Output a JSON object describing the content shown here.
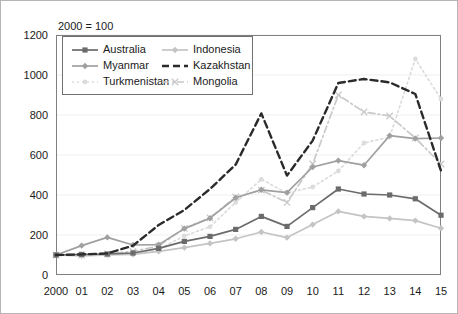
{
  "note": "2000 = 100",
  "legend": {
    "entries": [
      {
        "name": "Australia",
        "color": "#6b6b6b",
        "dash": "none",
        "marker": "square"
      },
      {
        "name": "Indonesia",
        "color": "#c4c4c4",
        "dash": "none",
        "marker": "diamond"
      },
      {
        "name": "Myanmar",
        "color": "#a0a0a0",
        "dash": "none",
        "marker": "diamond"
      },
      {
        "name": "Kazakhstan",
        "color": "#2b2b2b",
        "dash": "dashed",
        "marker": "none"
      },
      {
        "name": "Turkmenistan",
        "color": "#dcdcdc",
        "dash": "dotted",
        "marker": "circle"
      },
      {
        "name": "Mongolia",
        "color": "#c9c9c9",
        "dash": "dashdot",
        "marker": "cross"
      }
    ]
  },
  "chart_data": {
    "type": "line",
    "title": "",
    "subtitle": "2000 = 100",
    "xlabel": "",
    "ylabel": "",
    "ylim": [
      0,
      1200
    ],
    "yticks": [
      0,
      200,
      400,
      600,
      800,
      1000,
      1200
    ],
    "grid": true,
    "legend_position": "top-left-inside",
    "categories": [
      "2000",
      "01",
      "02",
      "03",
      "04",
      "05",
      "06",
      "07",
      "08",
      "09",
      "10",
      "11",
      "12",
      "13",
      "14",
      "15"
    ],
    "series": [
      {
        "name": "Australia",
        "color": "#6b6b6b",
        "dash": "none",
        "marker": "square",
        "values": [
          100,
          103,
          105,
          110,
          133,
          168,
          193,
          228,
          293,
          243,
          337,
          430,
          405,
          400,
          381,
          299
        ]
      },
      {
        "name": "Indonesia",
        "color": "#c4c4c4",
        "dash": "none",
        "marker": "diamond",
        "values": [
          100,
          95,
          100,
          103,
          118,
          137,
          158,
          181,
          215,
          187,
          252,
          318,
          293,
          283,
          272,
          234
        ]
      },
      {
        "name": "Myanmar",
        "color": "#a0a0a0",
        "dash": "none",
        "marker": "diamond",
        "values": [
          100,
          147,
          188,
          150,
          152,
          232,
          284,
          386,
          426,
          412,
          540,
          572,
          549,
          697,
          682,
          685
        ]
      },
      {
        "name": "Kazakhstan",
        "color": "#2b2b2b",
        "dash": "dashed",
        "marker": "none",
        "values": [
          100,
          103,
          108,
          147,
          250,
          325,
          430,
          552,
          808,
          497,
          672,
          960,
          980,
          963,
          905,
          521
        ]
      },
      {
        "name": "Turkmenistan",
        "color": "#dcdcdc",
        "dash": "dotted",
        "marker": "circle",
        "values": [
          100,
          97,
          105,
          107,
          128,
          196,
          241,
          363,
          478,
          410,
          440,
          520,
          660,
          690,
          1080,
          880
        ]
      },
      {
        "name": "Mongolia",
        "color": "#c9c9c9",
        "dash": "dashdot",
        "marker": "cross",
        "values": [
          100,
          100,
          105,
          118,
          145,
          233,
          286,
          390,
          424,
          363,
          555,
          900,
          815,
          795,
          685,
          555
        ]
      }
    ]
  }
}
